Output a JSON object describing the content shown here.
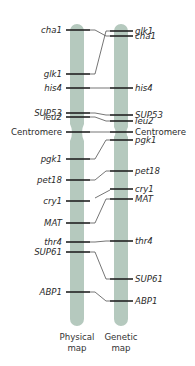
{
  "colors": {
    "chromosome": "#b5c9be",
    "band": "#222222",
    "connector": "#3a3a3a",
    "text": "#2b2b2b"
  },
  "diagram": {
    "physical_map": {
      "caption_line1": "Physical",
      "caption_line2": "map",
      "markers": [
        {
          "name": "cha1",
          "y": 30,
          "italic": true
        },
        {
          "name": "glk1",
          "y": 74,
          "italic": true
        },
        {
          "name": "his4",
          "y": 88,
          "italic": true
        },
        {
          "name": "SUP53",
          "y": 113,
          "italic": true
        },
        {
          "name": "leu2",
          "y": 117,
          "italic": true
        },
        {
          "name": "Centromere",
          "y": 132,
          "italic": false
        },
        {
          "name": "pgk1",
          "y": 159,
          "italic": true
        },
        {
          "name": "pet18",
          "y": 180,
          "italic": true
        },
        {
          "name": "cry1",
          "y": 201,
          "italic": true
        },
        {
          "name": "MAT",
          "y": 223,
          "italic": true
        },
        {
          "name": "thr4",
          "y": 242,
          "italic": true
        },
        {
          "name": "SUP61",
          "y": 252,
          "italic": true
        },
        {
          "name": "ABP1",
          "y": 292,
          "italic": true
        }
      ]
    },
    "genetic_map": {
      "caption_line1": "Genetic",
      "caption_line2": "map",
      "markers": [
        {
          "name": "glk1",
          "y": 31,
          "italic": true
        },
        {
          "name": "cha1",
          "y": 36,
          "italic": true
        },
        {
          "name": "his4",
          "y": 88,
          "italic": true
        },
        {
          "name": "SUP53",
          "y": 115,
          "italic": true
        },
        {
          "name": "leu2",
          "y": 121,
          "italic": true
        },
        {
          "name": "Centromere",
          "y": 132,
          "italic": false
        },
        {
          "name": "pgk1",
          "y": 140,
          "italic": true
        },
        {
          "name": "pet18",
          "y": 171,
          "italic": true
        },
        {
          "name": "cry1",
          "y": 189,
          "italic": true
        },
        {
          "name": "MAT",
          "y": 199,
          "italic": true
        },
        {
          "name": "thr4",
          "y": 241,
          "italic": true
        },
        {
          "name": "SUP61",
          "y": 279,
          "italic": true
        },
        {
          "name": "ABP1",
          "y": 301,
          "italic": true
        }
      ]
    }
  }
}
